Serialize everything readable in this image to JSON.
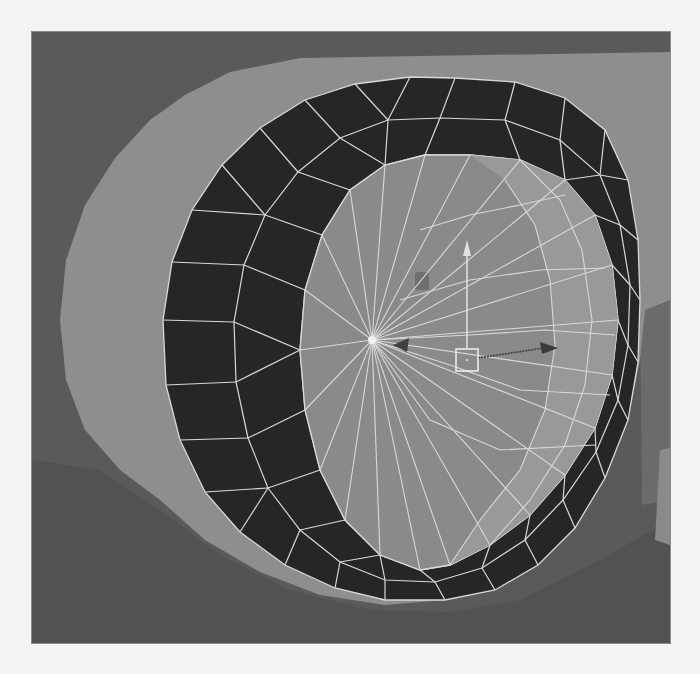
{
  "viewport": {
    "label": "3D viewport",
    "offset": [
      32,
      32
    ],
    "size": [
      638,
      611
    ],
    "background_color": "#5e5e5e"
  },
  "scene": {
    "colors": {
      "background_top": "#5a5a5a",
      "background_bottom": "#585858",
      "far_wall": "#7c7c7c",
      "far_wall_shadow": "#6b6b6b",
      "tire_body": "#8e8e8e",
      "tire_body_shadow": "#7a7a7a",
      "ground_shadow": "#525252",
      "ring_face": "#262626",
      "hub_face": "#8a8a8a",
      "hub_face_light": "#999999",
      "hub_face_dark": "#7d7d7d",
      "wire": "#d8d8d8",
      "side_block": "#8a8a8a",
      "side_block_dark": "#6a6a6a"
    },
    "hub_center": [
      372,
      340
    ],
    "ring_outer": [
      [
        455,
        78
      ],
      [
        515,
        82
      ],
      [
        565,
        98
      ],
      [
        605,
        130
      ],
      [
        628,
        180
      ],
      [
        638,
        240
      ],
      [
        640,
        300
      ],
      [
        638,
        362
      ],
      [
        628,
        420
      ],
      [
        605,
        478
      ],
      [
        575,
        528
      ],
      [
        538,
        565
      ],
      [
        495,
        590
      ],
      [
        445,
        600
      ],
      [
        385,
        600
      ],
      [
        335,
        588
      ],
      [
        285,
        565
      ],
      [
        240,
        532
      ],
      [
        205,
        492
      ],
      [
        180,
        440
      ],
      [
        166,
        385
      ],
      [
        163,
        320
      ],
      [
        172,
        262
      ],
      [
        192,
        210
      ],
      [
        222,
        165
      ],
      [
        260,
        128
      ],
      [
        305,
        100
      ],
      [
        355,
        84
      ],
      [
        410,
        77
      ]
    ],
    "ring_inner": [
      [
        470,
        155
      ],
      [
        520,
        160
      ],
      [
        565,
        180
      ],
      [
        595,
        215
      ],
      [
        612,
        265
      ],
      [
        618,
        320
      ],
      [
        612,
        375
      ],
      [
        595,
        428
      ],
      [
        565,
        475
      ],
      [
        530,
        515
      ],
      [
        490,
        545
      ],
      [
        450,
        565
      ],
      [
        420,
        570
      ],
      [
        380,
        555
      ],
      [
        345,
        520
      ],
      [
        320,
        470
      ],
      [
        305,
        410
      ],
      [
        300,
        350
      ],
      [
        305,
        290
      ],
      [
        322,
        235
      ],
      [
        350,
        190
      ],
      [
        385,
        165
      ],
      [
        425,
        155
      ]
    ],
    "ring_mid": [
      [
        440,
        118
      ],
      [
        505,
        120
      ],
      [
        560,
        140
      ],
      [
        600,
        175
      ],
      [
        620,
        225
      ],
      [
        630,
        285
      ],
      [
        628,
        345
      ],
      [
        618,
        400
      ],
      [
        596,
        452
      ],
      [
        563,
        500
      ],
      [
        525,
        540
      ],
      [
        482,
        568
      ],
      [
        435,
        582
      ],
      [
        385,
        580
      ],
      [
        340,
        562
      ],
      [
        300,
        530
      ],
      [
        268,
        488
      ],
      [
        248,
        438
      ],
      [
        236,
        382
      ],
      [
        234,
        322
      ],
      [
        244,
        265
      ],
      [
        265,
        215
      ],
      [
        298,
        172
      ],
      [
        340,
        138
      ],
      [
        388,
        120
      ]
    ],
    "tire_body": [
      [
        60,
        320
      ],
      [
        66,
        260
      ],
      [
        85,
        205
      ],
      [
        115,
        158
      ],
      [
        150,
        120
      ],
      [
        185,
        95
      ],
      [
        230,
        72
      ],
      [
        300,
        58
      ],
      [
        380,
        52
      ],
      [
        470,
        50
      ],
      [
        580,
        48
      ],
      [
        670,
        46
      ],
      [
        670,
        300
      ],
      [
        645,
        310
      ],
      [
        640,
        360
      ],
      [
        628,
        420
      ],
      [
        605,
        478
      ],
      [
        575,
        528
      ],
      [
        538,
        565
      ],
      [
        495,
        590
      ],
      [
        445,
        600
      ],
      [
        385,
        605
      ],
      [
        320,
        595
      ],
      [
        260,
        572
      ],
      [
        205,
        540
      ],
      [
        160,
        500
      ],
      [
        120,
        470
      ],
      [
        85,
        430
      ],
      [
        66,
        380
      ]
    ],
    "top_band": [
      [
        32,
        32
      ],
      [
        670,
        32
      ],
      [
        670,
        52
      ],
      [
        300,
        58
      ],
      [
        220,
        70
      ],
      [
        170,
        92
      ],
      [
        130,
        125
      ],
      [
        95,
        170
      ],
      [
        70,
        220
      ],
      [
        55,
        280
      ],
      [
        50,
        340
      ],
      [
        32,
        340
      ]
    ],
    "ground_shadow": [
      [
        32,
        460
      ],
      [
        100,
        470
      ],
      [
        160,
        510
      ],
      [
        220,
        555
      ],
      [
        290,
        590
      ],
      [
        370,
        610
      ],
      [
        450,
        612
      ],
      [
        520,
        600
      ],
      [
        600,
        560
      ],
      [
        670,
        520
      ],
      [
        670,
        643
      ],
      [
        32,
        643
      ]
    ],
    "side_block": [
      [
        660,
        450
      ],
      [
        670,
        448
      ],
      [
        670,
        545
      ],
      [
        655,
        540
      ]
    ],
    "right_wall": [
      [
        640,
        305
      ],
      [
        670,
        298
      ],
      [
        670,
        500
      ],
      [
        642,
        505
      ]
    ],
    "hub_light_panel": [
      [
        470,
        155
      ],
      [
        520,
        160
      ],
      [
        565,
        180
      ],
      [
        595,
        215
      ],
      [
        612,
        265
      ],
      [
        618,
        320
      ],
      [
        612,
        375
      ],
      [
        595,
        428
      ],
      [
        565,
        475
      ],
      [
        530,
        515
      ],
      [
        490,
        545
      ],
      [
        450,
        565
      ],
      [
        480,
        520
      ],
      [
        520,
        470
      ],
      [
        545,
        410
      ],
      [
        555,
        345
      ],
      [
        550,
        280
      ],
      [
        535,
        225
      ],
      [
        505,
        180
      ]
    ],
    "hub_rings": [
      [
        [
          505,
          180
        ],
        [
          535,
          225
        ],
        [
          550,
          280
        ],
        [
          555,
          345
        ],
        [
          545,
          410
        ],
        [
          520,
          470
        ],
        [
          480,
          520
        ],
        [
          450,
          565
        ]
      ],
      [
        [
          520,
          160
        ],
        [
          560,
          200
        ],
        [
          582,
          250
        ],
        [
          592,
          320
        ],
        [
          585,
          385
        ],
        [
          565,
          445
        ],
        [
          530,
          500
        ],
        [
          490,
          545
        ]
      ]
    ],
    "hub_latitudes": [
      [
        [
          420,
          230
        ],
        [
          470,
          215
        ],
        [
          520,
          205
        ],
        [
          565,
          195
        ]
      ],
      [
        [
          400,
          300
        ],
        [
          470,
          280
        ],
        [
          540,
          270
        ],
        [
          605,
          268
        ]
      ],
      [
        [
          372,
          340
        ],
        [
          470,
          335
        ],
        [
          545,
          330
        ],
        [
          615,
          335
        ]
      ],
      [
        [
          372,
          340
        ],
        [
          450,
          365
        ],
        [
          520,
          390
        ],
        [
          610,
          395
        ]
      ],
      [
        [
          372,
          340
        ],
        [
          430,
          420
        ],
        [
          500,
          450
        ],
        [
          595,
          445
        ]
      ]
    ],
    "gizmo": {
      "center": [
        467,
        360
      ],
      "box_size": 22,
      "y_arrow_tip": [
        467,
        240
      ],
      "x_arrow_tip": [
        558,
        348
      ],
      "z_arrow_tip": [
        393,
        345
      ],
      "y_color": "#e2e2e2",
      "x_color": "#3a3a3a",
      "z_color": "#3f3f3f",
      "box_color": "#ececec"
    },
    "small_marker": {
      "position": [
        415,
        272
      ],
      "size": [
        14,
        18
      ],
      "color": "#6e6e6e"
    }
  }
}
